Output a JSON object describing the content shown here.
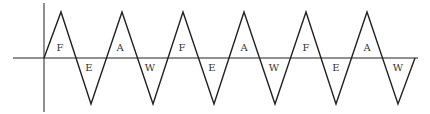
{
  "diagram": {
    "type": "triangle-wave",
    "colors": {
      "stroke": "#222222",
      "background": "#ffffff",
      "label": "#333333"
    },
    "axes": {
      "horizontal": {
        "x1": 13,
        "x2": 418,
        "y": 58
      },
      "vertical": {
        "x": 44,
        "y1": 3,
        "y2": 112
      }
    },
    "wave_points": [
      [
        44,
        58
      ],
      [
        61,
        12
      ],
      [
        91,
        104
      ],
      [
        122,
        12
      ],
      [
        153,
        104
      ],
      [
        183,
        12
      ],
      [
        214,
        104
      ],
      [
        244,
        12
      ],
      [
        275,
        104
      ],
      [
        306,
        12
      ],
      [
        336,
        104
      ],
      [
        367,
        12
      ],
      [
        398,
        104
      ],
      [
        415,
        58
      ]
    ],
    "labels": [
      {
        "text": "F",
        "x": 60,
        "y": 51
      },
      {
        "text": "E",
        "x": 89,
        "y": 71
      },
      {
        "text": "A",
        "x": 120,
        "y": 51
      },
      {
        "text": "W",
        "x": 150,
        "y": 71
      },
      {
        "text": "F",
        "x": 182,
        "y": 51
      },
      {
        "text": "E",
        "x": 212,
        "y": 71
      },
      {
        "text": "A",
        "x": 244,
        "y": 51
      },
      {
        "text": "W",
        "x": 274,
        "y": 71
      },
      {
        "text": "F",
        "x": 306,
        "y": 51
      },
      {
        "text": "E",
        "x": 336,
        "y": 71
      },
      {
        "text": "A",
        "x": 367,
        "y": 51
      },
      {
        "text": "W",
        "x": 398,
        "y": 71
      }
    ]
  }
}
